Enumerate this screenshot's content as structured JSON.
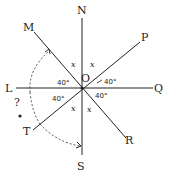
{
  "diagram": {
    "center": {
      "label": "O",
      "x": 82,
      "y": 88
    },
    "points": [
      {
        "label": "N",
        "x": 82,
        "y": 11
      },
      {
        "label": "S",
        "x": 82,
        "y": 165
      },
      {
        "label": "L",
        "x": 10,
        "y": 92
      },
      {
        "label": "Q",
        "x": 158,
        "y": 92
      },
      {
        "label": "M",
        "x": 27,
        "y": 29
      },
      {
        "label": "P",
        "x": 144,
        "y": 40
      },
      {
        "label": "T",
        "x": 27,
        "y": 134
      },
      {
        "label": "R",
        "x": 129,
        "y": 145
      }
    ],
    "angle_labels": {
      "upper_left": "40°",
      "upper_right": "40°",
      "lower_left": "40°",
      "lower_right": "40°"
    },
    "variable_labels": {
      "nw": "x",
      "ne": "x",
      "sw": "x",
      "se": "x"
    },
    "unknown_marker": "?",
    "line_color": "#222222",
    "background": "#ffffff"
  }
}
